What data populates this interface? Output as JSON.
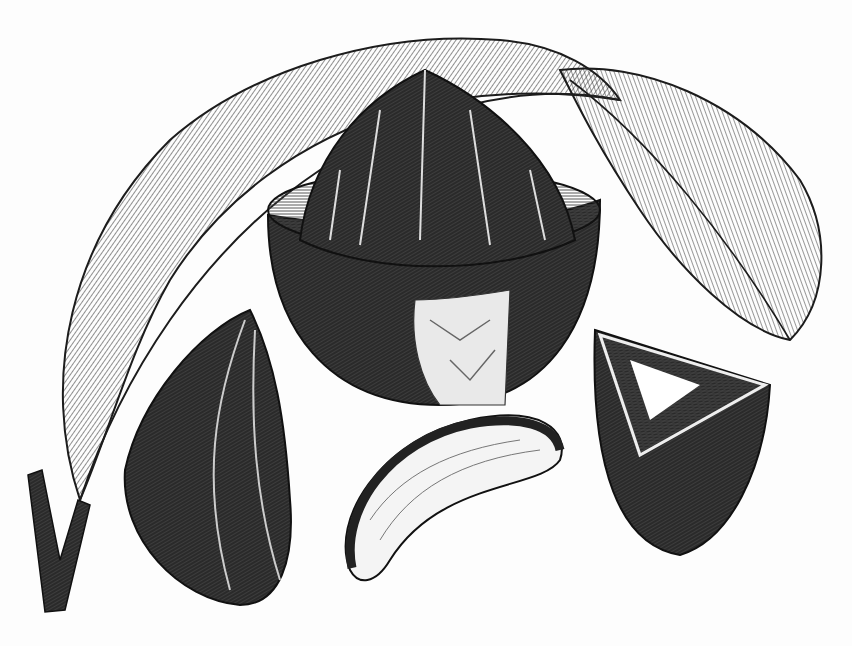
{
  "image": {
    "subject": "Brazil nut engraving",
    "description": "Black-and-white wood engraving of a Brazil nut branch: large leaves, an opened seed pod revealing nuts, a single nut in shell, a shelled kernel, and a cross-section of a nut",
    "background_color": "#fdfdfd",
    "ink_color": "#1c1c1c",
    "elements": [
      {
        "name": "leaf-left",
        "label": "Large veined leaf arching from stem"
      },
      {
        "name": "leaf-right",
        "label": "Leaf extending to right"
      },
      {
        "name": "open-pod",
        "label": "Halved seed pod with nuts inside"
      },
      {
        "name": "nut-in-shell",
        "label": "Ridged nut in shell, lower left"
      },
      {
        "name": "kernel",
        "label": "Shelled nut kernel, bottom center"
      },
      {
        "name": "nut-cross-section",
        "label": "Cut nut showing kernel, right"
      },
      {
        "name": "stem",
        "label": "Branch stem, bottom left"
      }
    ]
  }
}
